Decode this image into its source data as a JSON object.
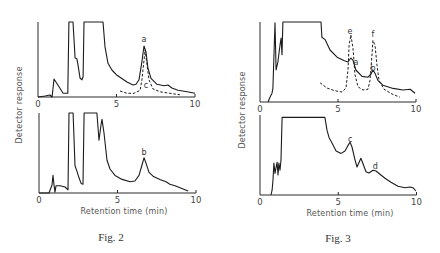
{
  "figures": [
    {
      "caption": "Fig. 2",
      "xlabel": "Retention time (min)",
      "ylabel": "Detector response"
    },
    {
      "caption": "Fig. 3",
      "xlabel": "Retention time (min)",
      "ylabel": "Detector response"
    }
  ],
  "colors": {
    "trace": "#1c1c1c",
    "text": "#444444",
    "background": "#ffffff"
  },
  "chart_data": [
    {
      "type": "line",
      "title": "Fig. 2",
      "xlabel": "Retention time (min)",
      "ylabel": "Detector response",
      "xlim": [
        0,
        10
      ],
      "xticks": [
        0,
        5,
        10
      ],
      "ylim": [
        0,
        100
      ],
      "y_units": "relative response (100 = off-scale / top of axis)",
      "grid": false,
      "legend": null,
      "panels": [
        {
          "id": "fig2-top",
          "series": [
            {
              "name": "sample trace",
              "style": "solid",
              "points": [
                [
                  0,
                  0
                ],
                [
                  0.45,
                  1.3
                ],
                [
                  0.76,
                  2.7
                ],
                [
                  0.9,
                  0
                ],
                [
                  1.02,
                  24
                ],
                [
                  1.27,
                  16
                ],
                [
                  1.6,
                  5
                ],
                [
                  1.9,
                  5
                ],
                [
                  1.97,
                  100
                ],
                [
                  2.23,
                  100
                ],
                [
                  2.36,
                  52
                ],
                [
                  2.48,
                  51
                ],
                [
                  2.55,
                  43
                ],
                [
                  2.68,
                  25
                ],
                [
                  2.8,
                  23
                ],
                [
                  2.87,
                  27
                ],
                [
                  2.93,
                  100
                ],
                [
                  4.14,
                  100
                ],
                [
                  4.27,
                  67
                ],
                [
                  4.46,
                  45
                ],
                [
                  4.71,
                  36
                ],
                [
                  5.03,
                  29
                ],
                [
                  5.67,
                  20
                ],
                [
                  6.05,
                  16
                ],
                [
                  6.24,
                  17
                ],
                [
                  6.43,
                  23
                ],
                [
                  6.62,
                  47
                ],
                [
                  6.75,
                  68
                ],
                [
                  6.88,
                  60
                ],
                [
                  7.0,
                  39
                ],
                [
                  7.2,
                  25
                ],
                [
                  7.58,
                  17
                ],
                [
                  8.03,
                  15
                ],
                [
                  8.28,
                  16
                ],
                [
                  8.53,
                  12
                ],
                [
                  8.92,
                  9
                ],
                [
                  9.5,
                  7
                ],
                [
                  10,
                  5
                ]
              ]
            },
            {
              "name": "standard c",
              "style": "dashed",
              "points": [
                [
                  5.22,
                  8
                ],
                [
                  5.67,
                  5
                ],
                [
                  6.11,
                  5
                ],
                [
                  6.5,
                  9
                ],
                [
                  6.62,
                  23
                ],
                [
                  6.75,
                  49
                ],
                [
                  6.82,
                  63
                ],
                [
                  6.94,
                  43
                ],
                [
                  7.07,
                  23
                ],
                [
                  7.32,
                  11
                ],
                [
                  7.77,
                  7
                ],
                [
                  8.4,
                  5
                ],
                [
                  9.04,
                  3
                ]
              ]
            }
          ],
          "peak_labels": [
            {
              "text": "a",
              "t": 6.75,
              "v": 77
            },
            {
              "text": "c",
              "t": 6.88,
              "v": 16
            }
          ]
        },
        {
          "id": "fig2-bottom",
          "series": [
            {
              "name": "sample trace",
              "style": "solid",
              "points": [
                [
                  0,
                  0
                ],
                [
                  0.64,
                  0
                ],
                [
                  0.83,
                  10
                ],
                [
                  0.89,
                  22
                ],
                [
                  0.96,
                  9
                ],
                [
                  1.02,
                  1
                ],
                [
                  1.08,
                  9
                ],
                [
                  1.34,
                  9
                ],
                [
                  1.66,
                  7.5
                ],
                [
                  1.85,
                  4
                ],
                [
                  1.91,
                  100
                ],
                [
                  2.17,
                  100
                ],
                [
                  2.29,
                  34
                ],
                [
                  2.42,
                  27
                ],
                [
                  2.55,
                  19
                ],
                [
                  2.68,
                  12
                ],
                [
                  2.8,
                  11
                ],
                [
                  2.87,
                  100
                ],
                [
                  3.69,
                  100
                ],
                [
                  3.82,
                  66
                ],
                [
                  3.95,
                  85
                ],
                [
                  4.01,
                  92
                ],
                [
                  4.14,
                  75
                ],
                [
                  4.33,
                  41
                ],
                [
                  4.52,
                  30
                ],
                [
                  4.84,
                  22
                ],
                [
                  5.29,
                  17
                ],
                [
                  5.8,
                  14
                ],
                [
                  6.11,
                  15
                ],
                [
                  6.37,
                  22
                ],
                [
                  6.56,
                  35
                ],
                [
                  6.69,
                  44
                ],
                [
                  6.82,
                  37
                ],
                [
                  7.0,
                  26
                ],
                [
                  7.26,
                  21
                ],
                [
                  7.7,
                  17
                ],
                [
                  8.09,
                  14
                ],
                [
                  8.34,
                  11
                ],
                [
                  8.66,
                  9
                ],
                [
                  9.3,
                  4
                ],
                [
                  9.5,
                  2.5
                ]
              ]
            }
          ],
          "peak_labels": [
            {
              "text": "b",
              "t": 6.69,
              "v": 51
            }
          ]
        }
      ]
    },
    {
      "type": "line",
      "title": "Fig. 3",
      "xlabel": "Retention time (min)",
      "ylabel": "Detector response",
      "xlim": [
        0,
        10
      ],
      "xticks": [
        0,
        5,
        10
      ],
      "ylim": [
        0,
        100
      ],
      "y_units": "relative response (100 = off-scale / top of axis)",
      "grid": false,
      "legend": null,
      "panels": [
        {
          "id": "fig3-top",
          "series": [
            {
              "name": "sample trace",
              "style": "solid",
              "points": [
                [
                  0.51,
                  0
                ],
                [
                  0.64,
                  6
                ],
                [
                  0.77,
                  11
                ],
                [
                  0.83,
                  17
                ],
                [
                  0.96,
                  99
                ],
                [
                  1.03,
                  40
                ],
                [
                  1.15,
                  50
                ],
                [
                  1.28,
                  71
                ],
                [
                  1.35,
                  80
                ],
                [
                  1.41,
                  59
                ],
                [
                  1.47,
                  100
                ],
                [
                  3.91,
                  100
                ],
                [
                  3.97,
                  81
                ],
                [
                  4.17,
                  78
                ],
                [
                  4.49,
                  65
                ],
                [
                  4.94,
                  56
                ],
                [
                  5.38,
                  52
                ],
                [
                  5.64,
                  50
                ],
                [
                  5.83,
                  55
                ],
                [
                  5.96,
                  52
                ],
                [
                  6.15,
                  40
                ],
                [
                  6.54,
                  32
                ],
                [
                  6.92,
                  31
                ],
                [
                  7.12,
                  35
                ],
                [
                  7.24,
                  40
                ],
                [
                  7.37,
                  36
                ],
                [
                  7.56,
                  27
                ],
                [
                  7.88,
                  21
                ],
                [
                  8.53,
                  17
                ],
                [
                  9.17,
                  15
                ],
                [
                  9.62,
                  16
                ],
                [
                  9.94,
                  11
                ]
              ]
            },
            {
              "name": "standards e, f",
              "style": "dashed",
              "points": [
                [
                  3.85,
                  24
                ],
                [
                  4.29,
                  17.5
                ],
                [
                  4.81,
                  14
                ],
                [
                  5.26,
                  12.5
                ],
                [
                  5.51,
                  17.5
                ],
                [
                  5.64,
                  40
                ],
                [
                  5.71,
                  71
                ],
                [
                  5.83,
                  84
                ],
                [
                  5.96,
                  67
                ],
                [
                  6.09,
                  34
                ],
                [
                  6.28,
                  19
                ],
                [
                  6.6,
                  15
                ],
                [
                  6.92,
                  16
                ],
                [
                  7.05,
                  27
                ],
                [
                  7.18,
                  59
                ],
                [
                  7.24,
                  77
                ],
                [
                  7.37,
                  71
                ],
                [
                  7.5,
                  46
                ],
                [
                  7.63,
                  27
                ],
                [
                  7.95,
                  16
                ],
                [
                  8.46,
                  10
                ],
                [
                  8.97,
                  6
                ]
              ]
            }
          ],
          "peak_labels": [
            {
              "text": "e",
              "t": 5.77,
              "v": 88
            },
            {
              "text": "f",
              "t": 7.24,
              "v": 84
            },
            {
              "text": "a",
              "t": 6.15,
              "v": 49
            },
            {
              "text": "b",
              "t": 7.24,
              "v": 42
            }
          ]
        },
        {
          "id": "fig3-bottom",
          "series": [
            {
              "name": "sample trace",
              "style": "solid",
              "points": [
                [
                  0.7,
                  0
                ],
                [
                  0.77,
                  6
                ],
                [
                  0.83,
                  19
                ],
                [
                  0.89,
                  40
                ],
                [
                  0.96,
                  27
                ],
                [
                  1.02,
                  34
                ],
                [
                  1.09,
                  41
                ],
                [
                  1.15,
                  25
                ],
                [
                  1.21,
                  40
                ],
                [
                  1.28,
                  31
                ],
                [
                  1.34,
                  44
                ],
                [
                  1.41,
                  97
                ],
                [
                  4.15,
                  97
                ],
                [
                  4.28,
                  81
                ],
                [
                  4.41,
                  72
                ],
                [
                  4.6,
                  65
                ],
                [
                  4.86,
                  55
                ],
                [
                  5.18,
                  52
                ],
                [
                  5.43,
                  55
                ],
                [
                  5.62,
                  62
                ],
                [
                  5.75,
                  66
                ],
                [
                  5.88,
                  60
                ],
                [
                  6.07,
                  44
                ],
                [
                  6.2,
                  35
                ],
                [
                  6.33,
                  41
                ],
                [
                  6.45,
                  46
                ],
                [
                  6.58,
                  39
                ],
                [
                  6.77,
                  29
                ],
                [
                  6.96,
                  27.5
                ],
                [
                  7.22,
                  31
                ],
                [
                  7.41,
                  30
                ],
                [
                  7.67,
                  26
                ],
                [
                  7.99,
                  21
                ],
                [
                  8.37,
                  16
                ],
                [
                  8.82,
                  11
                ],
                [
                  9.27,
                  9
                ],
                [
                  9.58,
                  10
                ],
                [
                  9.78,
                  9
                ],
                [
                  9.97,
                  5
                ]
              ]
            }
          ],
          "peak_labels": [
            {
              "text": "c",
              "t": 5.77,
              "v": 70
            },
            {
              "text": "d",
              "t": 7.37,
              "v": 36
            }
          ]
        }
      ]
    }
  ]
}
